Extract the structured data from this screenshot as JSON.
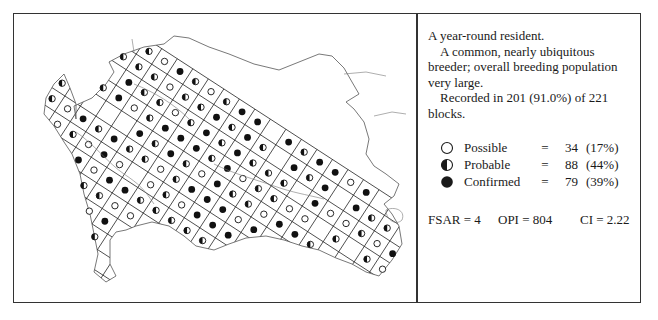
{
  "map": {
    "title": "Breeding distribution map",
    "grid": {
      "origin": [
        108,
        15
      ],
      "cell": 18.5,
      "angle_deg": 33,
      "rows": 22,
      "cols": 18
    },
    "outline_color": "#222222",
    "symbol_pattern_seed": 7
  },
  "species_text": {
    "status": "A year-round resident.",
    "breeding": "A common, nearly ubiquitous breeder; overall breeding population very large.",
    "recorded": "Recorded in 201 (91.0%) of 221 blocks."
  },
  "legend": {
    "items": [
      {
        "symbol": "open-circle",
        "label": "Possible",
        "eq": "=",
        "count": "34",
        "pct": "(17%)"
      },
      {
        "symbol": "half-circle",
        "label": "Probable",
        "eq": "=",
        "count": "88",
        "pct": "(44%)"
      },
      {
        "symbol": "filled-circle",
        "label": "Confirmed",
        "eq": "=",
        "count": "79",
        "pct": "(39%)"
      }
    ]
  },
  "stats": {
    "fsar": "FSAR = 4",
    "opi": "OPI = 804",
    "ci": "CI = 2.22"
  },
  "colors": {
    "ink": "#1a1a1a",
    "border": "#333333",
    "background": "#ffffff"
  }
}
